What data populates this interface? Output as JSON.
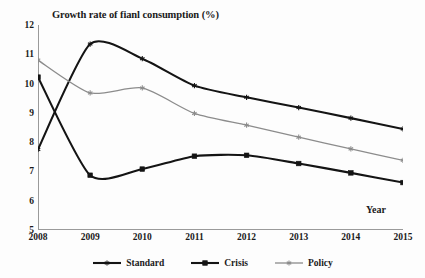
{
  "chart_data": {
    "type": "line",
    "title": "Growth rate of fianl consumption (%)",
    "xlabel": "Year",
    "ylabel": "",
    "categories": [
      "2008",
      "2009",
      "2010",
      "2011",
      "2012",
      "2013",
      "2014",
      "2015"
    ],
    "x": [
      2008,
      2009,
      2010,
      2011,
      2012,
      2013,
      2014,
      2015
    ],
    "xlim": [
      2008,
      2015
    ],
    "ylim": [
      5,
      12
    ],
    "yticks": [
      5,
      6,
      7,
      8,
      9,
      10,
      11,
      12
    ],
    "xticks": [
      "2008",
      "2009",
      "2010",
      "2011",
      "2012",
      "2013",
      "2014",
      "2015"
    ],
    "grid": false,
    "legend_position": "bottom",
    "series": [
      {
        "name": "Standard",
        "color": "#141414",
        "marker": "star",
        "line_width": 2.1,
        "values": [
          7.75,
          11.35,
          10.85,
          9.93,
          9.53,
          9.18,
          8.82,
          8.45
        ]
      },
      {
        "name": "Crisis",
        "color": "#141414",
        "marker": "square",
        "line_width": 2.1,
        "values": [
          10.22,
          6.87,
          7.08,
          7.52,
          7.55,
          7.27,
          6.95,
          6.62
        ]
      },
      {
        "name": "Policy",
        "color": "#8c8c8c",
        "marker": "star",
        "line_width": 1.3,
        "values": [
          10.8,
          9.68,
          9.85,
          8.98,
          8.58,
          8.17,
          7.77,
          7.38
        ]
      }
    ]
  },
  "legend": {
    "items": [
      {
        "label": "Standard"
      },
      {
        "label": "Crisis"
      },
      {
        "label": "Policy"
      }
    ]
  },
  "axes": {
    "axis_color": "#9a9a9a",
    "tick_color": "#9a9a9a"
  }
}
